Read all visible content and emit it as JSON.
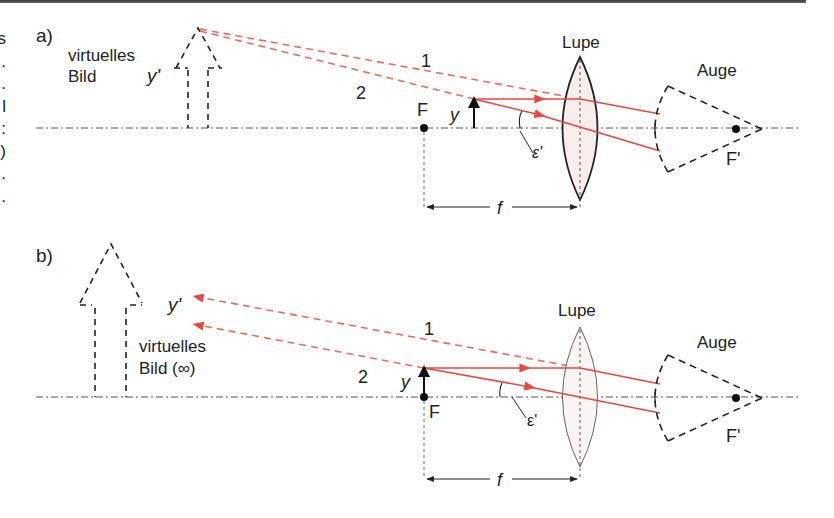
{
  "edge_fragments": [
    "s",
    ".",
    ".",
    "l",
    ":",
    ")",
    ".",
    "."
  ],
  "colors": {
    "ray": "#e8473f",
    "ray_dashed": "#ee6a5e",
    "line": "#222222",
    "axis": "#555555",
    "lens_fill": "#f7eeec"
  },
  "panel_a": {
    "label": "a)",
    "virtual_image_label_line1": "virtuelles",
    "virtual_image_label_line2": "Bild",
    "image_height_label": "y'",
    "ray1_label": "1",
    "ray2_label": "2",
    "focal_point_label": "F",
    "object_height_label": "y",
    "angle_label": "ε'",
    "lens_label": "Lupe",
    "eye_label": "Auge",
    "eye_focal_label": "F'",
    "focal_length_label": "f"
  },
  "panel_b": {
    "label": "b)",
    "virtual_image_label_line1": "virtuelles",
    "virtual_image_label_line2": "Bild (∞)",
    "image_height_label": "y'",
    "ray1_label": "1",
    "ray2_label": "2",
    "focal_point_label": "F",
    "object_height_label": "y",
    "angle_label": "ε'",
    "lens_label": "Lupe",
    "eye_label": "Auge",
    "eye_focal_label": "F'",
    "focal_length_label": "f"
  }
}
